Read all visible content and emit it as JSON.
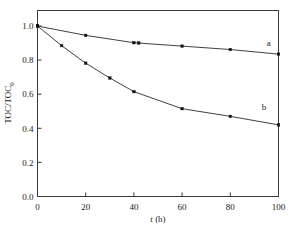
{
  "chart_data": {
    "type": "line",
    "title": "",
    "subtitle": "",
    "xlabel": "t (h)",
    "xlabel_italic_part": "t",
    "xlabel_rest": " (h)",
    "ylabel": "TOC/TOC0",
    "ylabel_main": "TOC/TOC",
    "ylabel_sub": "0",
    "xlim": [
      0,
      100
    ],
    "ylim": [
      0.0,
      1.0
    ],
    "xticks": [
      0,
      20,
      40,
      60,
      80,
      100
    ],
    "xtick_labels": [
      "0",
      "20",
      "40",
      "60",
      "80",
      "100"
    ],
    "yticks": [
      0.0,
      0.2,
      0.4,
      0.6,
      0.8,
      1.0
    ],
    "ytick_labels": [
      "0.0",
      "0.2",
      "0.4",
      "0.6",
      "0.8",
      "1.0"
    ],
    "grid": false,
    "legend": "inline-curve-labels",
    "marker": "filled-square",
    "series": [
      {
        "name": "a",
        "label": "a",
        "color": "#222222",
        "x": [
          0,
          20,
          40,
          42,
          60,
          80,
          100
        ],
        "values": [
          1.0,
          0.945,
          0.902,
          0.9,
          0.882,
          0.862,
          0.835
        ],
        "label_position": {
          "x": 96,
          "y": 0.885
        }
      },
      {
        "name": "b",
        "label": "b",
        "color": "#222222",
        "x": [
          0,
          10,
          20,
          30,
          40,
          60,
          80,
          100
        ],
        "values": [
          1.0,
          0.885,
          0.782,
          0.695,
          0.615,
          0.515,
          0.47,
          0.42
        ],
        "label_position": {
          "x": 94,
          "y": 0.505
        }
      }
    ],
    "annotations": [
      {
        "text": "a",
        "x": 96,
        "y": 0.885
      },
      {
        "text": "b",
        "x": 94,
        "y": 0.505
      }
    ]
  }
}
